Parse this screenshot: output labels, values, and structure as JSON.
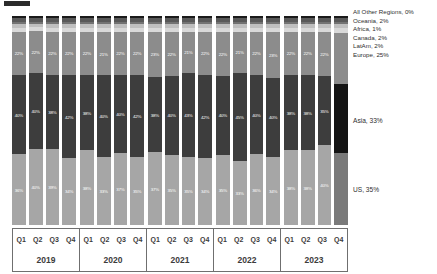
{
  "chart_data": {
    "type": "bar",
    "title": "",
    "subtitle": "",
    "xlabel": "",
    "ylabel": "",
    "stacked": true,
    "stack_total_percent": 100,
    "ylim": [
      0,
      100
    ],
    "grid": false,
    "legend_position": "right",
    "categories": [
      "Q1 2019",
      "Q2 2019",
      "Q3 2019",
      "Q4 2019",
      "Q1 2020",
      "Q2 2020",
      "Q3 2020",
      "Q4 2020",
      "Q1 2021",
      "Q2 2021",
      "Q3 2021",
      "Q4 2021",
      "Q1 2022",
      "Q2 2022",
      "Q3 2022",
      "Q4 2022",
      "Q1 2023",
      "Q2 2023",
      "Q3 2023",
      "Q4 2023"
    ],
    "series": [
      {
        "name": "US",
        "legend_label": "US, 35%",
        "latest_share": "35%",
        "color": "#a6a6a6",
        "values": [
          36,
          40,
          39,
          34,
          38,
          33,
          37,
          35,
          37,
          35,
          35,
          34,
          35,
          33,
          36,
          34,
          38,
          38,
          40,
          35
        ]
      },
      {
        "name": "Asia",
        "legend_label": "Asia, 33%",
        "latest_share": "33%",
        "color": "#3d3d3d",
        "values": [
          40,
          40,
          38,
          42,
          38,
          40,
          40,
          42,
          38,
          40,
          43,
          42,
          40,
          45,
          40,
          40,
          38,
          38,
          35,
          33
        ]
      },
      {
        "name": "Europe",
        "legend_label": "Europe, 25%",
        "latest_share": "25%",
        "color": "#8c8c8c",
        "values": [
          22,
          22,
          22,
          22,
          22,
          21,
          22,
          22,
          23,
          22,
          21,
          22,
          22,
          21,
          22,
          23,
          22,
          22,
          22,
          25
        ]
      },
      {
        "name": "LatAm",
        "legend_label": "LatAm, 2%",
        "latest_share": "2%",
        "color": "#d9d9d9",
        "values": [
          2,
          2,
          2,
          2,
          2,
          2,
          2,
          2,
          2,
          2,
          2,
          2,
          2,
          2,
          2,
          2,
          2,
          2,
          2,
          2
        ]
      },
      {
        "name": "Canada",
        "legend_label": "Canada, 2%",
        "latest_share": "2%",
        "color": "#bfbfbf",
        "values": [
          2,
          2,
          2,
          2,
          2,
          2,
          2,
          2,
          2,
          2,
          2,
          2,
          2,
          2,
          2,
          2,
          2,
          2,
          2,
          2
        ]
      },
      {
        "name": "Africa",
        "legend_label": "Africa, 1%",
        "latest_share": "1%",
        "color": "#737373",
        "values": [
          1,
          1,
          1,
          1,
          1,
          1,
          1,
          1,
          1,
          1,
          1,
          1,
          1,
          1,
          1,
          1,
          1,
          1,
          1,
          1
        ]
      },
      {
        "name": "Oceania",
        "legend_label": "Oceania, 2%",
        "latest_share": "2%",
        "color": "#595959",
        "values": [
          2,
          2,
          2,
          2,
          2,
          2,
          2,
          2,
          2,
          2,
          2,
          2,
          2,
          2,
          2,
          2,
          2,
          2,
          2,
          2
        ]
      },
      {
        "name": "All Other Regions",
        "legend_label": "All Other Regions, 0%",
        "latest_share": "0%",
        "color": "#1a1a1a",
        "values": [
          1,
          1,
          1,
          1,
          1,
          1,
          1,
          1,
          1,
          1,
          1,
          1,
          1,
          1,
          1,
          1,
          1,
          1,
          1,
          1
        ]
      }
    ],
    "visible_data_labels": {
      "US": [
        "36%",
        "40%",
        "39%",
        "34%",
        "38%",
        "33%",
        "37%",
        "35%",
        "37%",
        "35%",
        "35%",
        "34%",
        "35%",
        "33%",
        "36%",
        "34%",
        "38%",
        "38%",
        "40%",
        ""
      ],
      "Asia": [
        "40%",
        "40%",
        "38%",
        "42%",
        "38%",
        "40%",
        "40%",
        "42%",
        "38%",
        "40%",
        "43%",
        "42%",
        "40%",
        "45%",
        "40%",
        "40%",
        "38%",
        "38%",
        "35%",
        ""
      ],
      "Europe": [
        "22%",
        "22%",
        "22%",
        "22%",
        "22%",
        "21%",
        "22%",
        "22%",
        "23%",
        "22%",
        "21%",
        "22%",
        "22%",
        "21%",
        "22%",
        "23%",
        "22%",
        "22%",
        "22%",
        ""
      ]
    },
    "highlighted_category": "Q4 2023"
  },
  "legend": {
    "top_entries": [
      "All Other Regions, 0%",
      "Oceania, 2%",
      "Africa, 1%",
      "Canada, 2%",
      "LatAm, 2%",
      "Europe, 25%"
    ],
    "asia": "Asia, 33%",
    "us": "US, 35%"
  },
  "axis": {
    "quarters": [
      "Q1",
      "Q2",
      "Q3",
      "Q4"
    ],
    "years": [
      "2019",
      "2020",
      "2021",
      "2022",
      "2023"
    ]
  }
}
